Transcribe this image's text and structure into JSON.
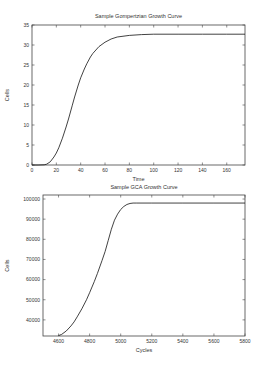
{
  "chart_data": [
    {
      "type": "line",
      "title": "Sample Gompertzian Growth Curve",
      "xlabel": "Time",
      "ylabel": "Cells",
      "xlim": [
        0,
        175
      ],
      "ylim": [
        0,
        35
      ],
      "xticks": [
        0,
        20,
        40,
        60,
        80,
        100,
        120,
        140,
        160
      ],
      "yticks": [
        0,
        5,
        10,
        15,
        20,
        25,
        30,
        35
      ],
      "grid": false,
      "legend": null,
      "series": [
        {
          "name": "Gompertz",
          "x": [
            0,
            5,
            10,
            12,
            15,
            18,
            20,
            22,
            25,
            28,
            30,
            33,
            35,
            38,
            40,
            43,
            45,
            48,
            50,
            55,
            60,
            65,
            70,
            80,
            90,
            100,
            120,
            140,
            160,
            175
          ],
          "y": [
            0,
            0,
            0.05,
            0.2,
            0.8,
            2.0,
            3.0,
            4.3,
            6.7,
            9.5,
            11.5,
            14.8,
            17.0,
            20.0,
            21.8,
            24.0,
            25.3,
            27.0,
            27.9,
            29.6,
            30.7,
            31.5,
            32.0,
            32.4,
            32.6,
            32.7,
            32.7,
            32.7,
            32.7,
            32.7
          ]
        }
      ]
    },
    {
      "type": "line",
      "title": "Sample GCA Growth Curve",
      "xlabel": "Cycles",
      "ylabel": "Cells",
      "xlim": [
        4500,
        5800
      ],
      "ylim": [
        32000,
        102000
      ],
      "xticks": [
        4600,
        4800,
        5000,
        5200,
        5400,
        5600,
        5800
      ],
      "yticks": [
        40000,
        50000,
        60000,
        70000,
        80000,
        90000,
        100000
      ],
      "grid": false,
      "legend": null,
      "series": [
        {
          "name": "GCA",
          "x": [
            4600,
            4620,
            4650,
            4680,
            4700,
            4720,
            4750,
            4780,
            4800,
            4830,
            4850,
            4880,
            4900,
            4920,
            4940,
            4960,
            4980,
            5000,
            5020,
            5040,
            5060,
            5080,
            5100,
            5200,
            5400,
            5600,
            5800
          ],
          "y": [
            32200,
            32800,
            34500,
            37000,
            39000,
            41500,
            45500,
            50000,
            53500,
            59000,
            63000,
            69500,
            74000,
            79500,
            85000,
            89500,
            92500,
            94800,
            96300,
            97300,
            97800,
            98000,
            98000,
            98000,
            98000,
            98000,
            98000
          ]
        }
      ]
    }
  ]
}
